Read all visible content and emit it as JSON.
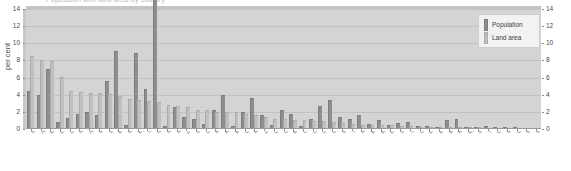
{
  "chart_data": {
    "type": "bar",
    "title": "Population and land area by country",
    "xlabel": "",
    "ylabel": "per cent",
    "ylim": [
      0,
      14
    ],
    "yticks": [
      0,
      2,
      4,
      6,
      8,
      10,
      12,
      14
    ],
    "grid": true,
    "legend_position": "top-right",
    "categories": [
      "Sudan",
      "Algeria",
      "Dem. Rep. Congo",
      "Libya",
      "Chad",
      "Niger",
      "Angola",
      "Mali",
      "South Africa",
      "Ethiopia",
      "Mauritania",
      "Egypt",
      "Tanzania",
      "Nigeria",
      "Namibia",
      "Mozambique",
      "Zambia",
      "Somalia",
      "Central African Rep.",
      "Madagascar",
      "Kenya",
      "Botswana",
      "Cameroon",
      "Morocco",
      "Zimbabwe",
      "Congo",
      "Côte d'Ivoire",
      "Burkina Faso",
      "Gabon",
      "Guinea",
      "Ghana",
      "Uganda",
      "Senegal",
      "Tunisia",
      "Malawi",
      "Eritrea",
      "Benin",
      "Liberia",
      "Sierra Leone",
      "Togo",
      "Guinea-Bissau",
      "Lesotho",
      "Equatorial Guinea",
      "Burundi",
      "Rwanda",
      "Djibouti",
      "Swaziland",
      "The Gambia",
      "Cape Verde",
      "Mauritius",
      "Comoros",
      "São Tomé",
      "Seychelles"
    ],
    "series": [
      {
        "name": "Population",
        "color": "#8e8e8e",
        "values": [
          4.3,
          3.9,
          6.9,
          0.7,
          1.2,
          1.6,
          1.9,
          1.5,
          5.5,
          9.0,
          0.4,
          8.8,
          4.6,
          16.0,
          0.2,
          2.4,
          1.3,
          1.0,
          0.5,
          2.1,
          3.9,
          0.2,
          1.9,
          3.5,
          1.5,
          0.4,
          2.1,
          1.6,
          0.2,
          1.0,
          2.6,
          3.3,
          1.3,
          1.1,
          1.5,
          0.5,
          0.9,
          0.4,
          0.6,
          0.7,
          0.2,
          0.2,
          0.1,
          0.9,
          1.0,
          0.1,
          0.1,
          0.2,
          0.1,
          0.1,
          0.1,
          0.0,
          0.0
        ]
      },
      {
        "name": "Land area",
        "color": "#c0c0c0",
        "values": [
          8.4,
          7.9,
          7.8,
          5.9,
          4.3,
          4.2,
          4.1,
          4.1,
          4.0,
          3.7,
          3.4,
          3.3,
          3.1,
          3.0,
          2.7,
          2.6,
          2.5,
          2.1,
          2.1,
          1.9,
          1.9,
          1.9,
          1.6,
          1.5,
          1.3,
          1.1,
          1.1,
          0.9,
          0.9,
          0.8,
          0.8,
          0.7,
          0.6,
          0.5,
          0.4,
          0.4,
          0.4,
          0.3,
          0.2,
          0.2,
          0.1,
          0.1,
          0.1,
          0.1,
          0.1,
          0.1,
          0.1,
          0.0,
          0.0,
          0.0,
          0.0,
          0.0,
          0.0
        ]
      }
    ]
  },
  "legend": {
    "population_label": "Population",
    "land_area_label": "Land area"
  },
  "axes": {
    "y_title": "per cent"
  }
}
